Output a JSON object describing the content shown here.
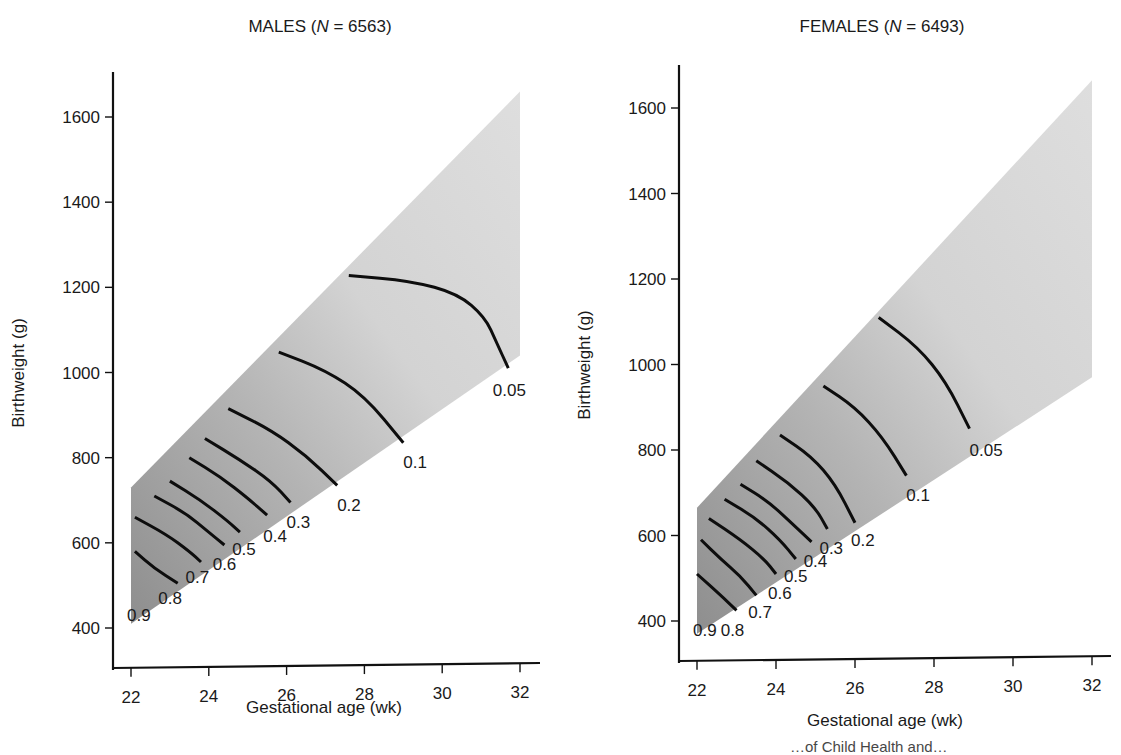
{
  "colors": {
    "shade_dark": "#8e8e8e",
    "shade_mid": "#b9b9b9",
    "shade_light": "#dcdcdc",
    "line": "#0d0d0d"
  },
  "caption_fragment": "…of Child Health and…",
  "chart_data": [
    {
      "type": "contour",
      "title": "MALES (N = 6563)",
      "title_parts": {
        "prefix": "MALES (",
        "italic": "N",
        "suffix": " = 6563)"
      },
      "xlabel": "Gestational age (wk)",
      "ylabel": "Birthweight (g)",
      "xlim": [
        21.5,
        32.5
      ],
      "ylim": [
        300,
        1750
      ],
      "x_ticks": [
        22,
        24,
        26,
        28,
        30,
        32
      ],
      "y_ticks": [
        400,
        600,
        800,
        1000,
        1200,
        1400,
        1600
      ],
      "grid": false,
      "shaded_region": [
        [
          22,
          410
        ],
        [
          22,
          730
        ],
        [
          32,
          1660
        ],
        [
          32,
          1040
        ]
      ],
      "contours": [
        {
          "level": "0.05",
          "points": [
            [
              27.6,
              1228
            ],
            [
              29.2,
              1215
            ],
            [
              30.4,
              1185
            ],
            [
              31.1,
              1130
            ],
            [
              31.4,
              1070
            ],
            [
              31.7,
              1010
            ]
          ],
          "label_pos": [
            31.3,
            960
          ]
        },
        {
          "level": "0.1",
          "points": [
            [
              25.8,
              1048
            ],
            [
              27.0,
              1005
            ],
            [
              28.0,
              945
            ],
            [
              29.0,
              835
            ]
          ],
          "label_pos": [
            29.0,
            790
          ]
        },
        {
          "level": "0.2",
          "points": [
            [
              24.5,
              915
            ],
            [
              25.6,
              865
            ],
            [
              26.5,
              805
            ],
            [
              27.3,
              735
            ]
          ],
          "label_pos": [
            27.3,
            690
          ]
        },
        {
          "level": "0.3",
          "points": [
            [
              23.9,
              845
            ],
            [
              24.8,
              795
            ],
            [
              25.6,
              745
            ],
            [
              26.1,
              695
            ]
          ],
          "label_pos": [
            26.0,
            650
          ]
        },
        {
          "level": "0.4",
          "points": [
            [
              23.5,
              800
            ],
            [
              24.3,
              755
            ],
            [
              25.0,
              705
            ],
            [
              25.5,
              665
            ]
          ],
          "label_pos": [
            25.4,
            615
          ]
        },
        {
          "level": "0.5",
          "points": [
            [
              23.0,
              745
            ],
            [
              23.8,
              700
            ],
            [
              24.5,
              650
            ],
            [
              24.8,
              625
            ]
          ],
          "label_pos": [
            24.6,
            585
          ]
        },
        {
          "level": "0.6",
          "points": [
            [
              22.6,
              710
            ],
            [
              23.4,
              670
            ],
            [
              24.0,
              625
            ],
            [
              24.4,
              595
            ]
          ],
          "label_pos": [
            24.1,
            550
          ]
        },
        {
          "level": "0.7",
          "points": [
            [
              22.1,
              660
            ],
            [
              22.9,
              620
            ],
            [
              23.5,
              580
            ],
            [
              23.8,
              555
            ]
          ],
          "label_pos": [
            23.4,
            520
          ]
        },
        {
          "level": "0.8",
          "points": [
            [
              22.1,
              580
            ],
            [
              22.6,
              540
            ],
            [
              23.2,
              505
            ]
          ],
          "label_pos": [
            22.7,
            470
          ]
        },
        {
          "level": "0.9",
          "points": [],
          "label_pos": [
            21.9,
            430
          ]
        }
      ]
    },
    {
      "type": "contour",
      "title": "FEMALES (N = 6493)",
      "title_parts": {
        "prefix": "FEMALES (",
        "italic": "N",
        "suffix": " = 6493)"
      },
      "xlabel": "Gestational age (wk)",
      "ylabel": "Birthweight (g)",
      "xlim": [
        21.5,
        32.5
      ],
      "ylim": [
        300,
        1700
      ],
      "x_ticks": [
        22,
        24,
        26,
        28,
        30,
        32
      ],
      "y_ticks": [
        400,
        600,
        800,
        1000,
        1200,
        1400,
        1600
      ],
      "grid": false,
      "shaded_region": [
        [
          22,
          370
        ],
        [
          22,
          665
        ],
        [
          32,
          1665
        ],
        [
          32,
          970
        ]
      ],
      "contours": [
        {
          "level": "0.05",
          "points": [
            [
              26.6,
              1110
            ],
            [
              27.6,
              1040
            ],
            [
              28.3,
              960
            ],
            [
              28.9,
              850
            ]
          ],
          "label_pos": [
            28.9,
            800
          ]
        },
        {
          "level": "0.1",
          "points": [
            [
              25.2,
              950
            ],
            [
              26.0,
              900
            ],
            [
              26.7,
              830
            ],
            [
              27.3,
              740
            ]
          ],
          "label_pos": [
            27.3,
            695
          ]
        },
        {
          "level": "0.2",
          "points": [
            [
              24.1,
              835
            ],
            [
              24.9,
              785
            ],
            [
              25.5,
              720
            ],
            [
              26.0,
              630
            ]
          ],
          "label_pos": [
            25.9,
            590
          ]
        },
        {
          "level": "0.3",
          "points": [
            [
              23.5,
              775
            ],
            [
              24.3,
              725
            ],
            [
              25.0,
              665
            ],
            [
              25.3,
              615
            ]
          ],
          "label_pos": [
            25.1,
            570
          ]
        },
        {
          "level": "0.4",
          "points": [
            [
              23.1,
              720
            ],
            [
              23.8,
              680
            ],
            [
              24.5,
              620
            ],
            [
              24.9,
              585
            ]
          ],
          "label_pos": [
            24.7,
            540
          ]
        },
        {
          "level": "0.5",
          "points": [
            [
              22.7,
              685
            ],
            [
              23.5,
              640
            ],
            [
              24.1,
              590
            ],
            [
              24.5,
              545
            ]
          ],
          "label_pos": [
            24.2,
            505
          ]
        },
        {
          "level": "0.6",
          "points": [
            [
              22.3,
              640
            ],
            [
              23.1,
              590
            ],
            [
              23.7,
              545
            ],
            [
              24.0,
              510
            ]
          ],
          "label_pos": [
            23.8,
            465
          ]
        },
        {
          "level": "0.7",
          "points": [
            [
              22.1,
              590
            ],
            [
              22.6,
              545
            ],
            [
              23.1,
              505
            ],
            [
              23.5,
              460
            ]
          ],
          "label_pos": [
            23.3,
            420
          ]
        },
        {
          "level": "0.8",
          "points": [
            [
              22.0,
              510
            ],
            [
              22.6,
              460
            ],
            [
              23.0,
              425
            ]
          ],
          "label_pos": [
            22.6,
            380
          ]
        },
        {
          "level": "0.9",
          "points": [],
          "label_pos": [
            21.9,
            380
          ]
        }
      ]
    }
  ]
}
